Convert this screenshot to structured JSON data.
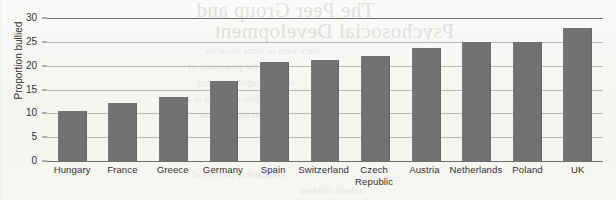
{
  "chart_data": {
    "type": "bar",
    "title": "",
    "xlabel": "",
    "ylabel": "Proportion bullied",
    "ylim": [
      0,
      30
    ],
    "yticks": [
      0,
      5,
      10,
      15,
      20,
      25,
      30
    ],
    "grid": true,
    "legend": "none",
    "bar_color": "#727272",
    "categories": [
      "Hungary",
      "France",
      "Greece",
      "Germany",
      "Spain",
      "Switzerland",
      "Czech Republic",
      "Austria",
      "Netherlands",
      "Poland",
      "UK"
    ],
    "category_lines": [
      [
        "Hungary"
      ],
      [
        "France"
      ],
      [
        "Greece"
      ],
      [
        "Germany"
      ],
      [
        "Spain"
      ],
      [
        "Switzerland"
      ],
      [
        "Czech",
        "Republic"
      ],
      [
        "Austria"
      ],
      [
        "Netherlands"
      ],
      [
        "Poland"
      ],
      [
        "UK"
      ]
    ],
    "values": [
      10.5,
      12.1,
      13.5,
      16.7,
      20.8,
      21.1,
      22.0,
      23.8,
      25.0,
      25.0,
      27.9
    ]
  },
  "bleed_through": {
    "title_line1": "The Peer Group and",
    "title_line2": "Psychosocial Development",
    "body_line1": "there were in some societies",
    "body_line2": "and the proportion of",
    "body_line3": "children reporting being",
    "body_line4": "bullied at school in a",
    "body_line5": "number of countries",
    "body_line6": "comparable surveys of",
    "body_line7": "school children"
  }
}
